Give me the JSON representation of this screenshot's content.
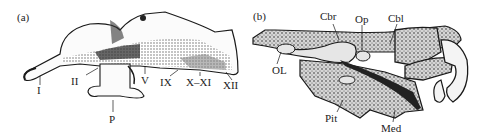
{
  "figure": {
    "panels": [
      {
        "id": "a",
        "tag": "(a)",
        "labels": {
          "I": "I",
          "II": "II",
          "P": "P",
          "V": "V",
          "IX": "IX",
          "X_XI": "X–XI",
          "XII": "XII"
        }
      },
      {
        "id": "b",
        "tag": "(b)",
        "labels": {
          "Cbr": "Cbr",
          "Op": "Op",
          "Cbl": "Cbl",
          "OL": "OL",
          "Pit": "Pit",
          "Med": "Med"
        }
      }
    ],
    "colors": {
      "ink": "#1a1a1a",
      "background": "#ffffff",
      "stipple_fill": "#cfcfcf",
      "cavity_fill": "#e6e6e6"
    }
  }
}
